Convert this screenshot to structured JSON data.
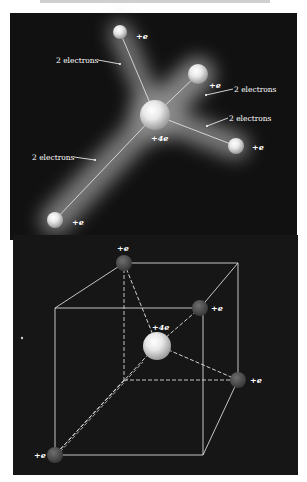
{
  "upper_diagram": {
    "background": "#111111",
    "center_atom": {
      "label": "+4e"
    },
    "outer_atoms": [
      {
        "label": "+e"
      },
      {
        "label": "+e"
      },
      {
        "label": "+e"
      },
      {
        "label": "+e"
      }
    ],
    "bond_labels": [
      {
        "text": "2 electrons"
      },
      {
        "text": "2 electrons"
      },
      {
        "text": "2 electrons"
      },
      {
        "text": "2 electrons"
      }
    ]
  },
  "lower_diagram": {
    "background": "#161616",
    "center_atom": {
      "label": "+4e"
    },
    "corner_atoms": [
      {
        "label": "+e"
      },
      {
        "label": "+e"
      },
      {
        "label": "+e"
      },
      {
        "label": "+e"
      }
    ]
  }
}
